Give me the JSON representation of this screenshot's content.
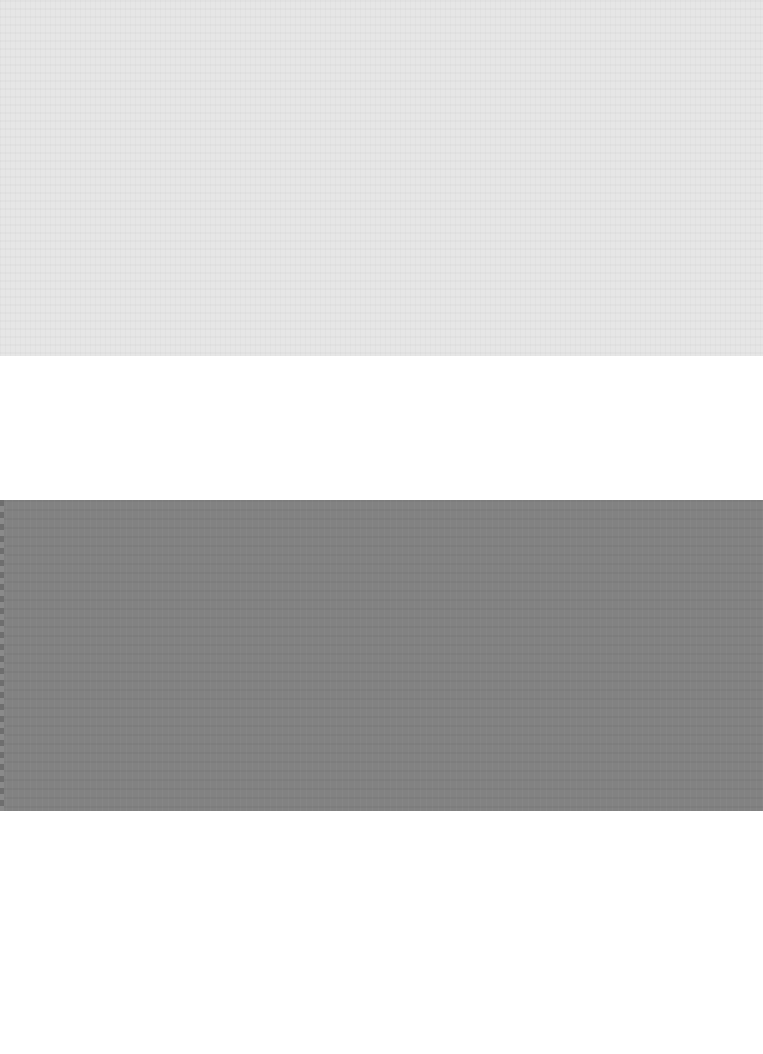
{
  "page": {
    "type": "scanned-blank-page",
    "bands": [
      {
        "name": "light-gray-band",
        "color": "#e6e6e6",
        "top": 0,
        "height": 356
      },
      {
        "name": "white-gap",
        "color": "#ffffff",
        "top": 356,
        "height": 144
      },
      {
        "name": "dark-gray-band",
        "color": "#828282",
        "top": 500,
        "height": 311
      },
      {
        "name": "white-bottom",
        "color": "#ffffff",
        "top": 811,
        "height": 243
      }
    ],
    "text": []
  }
}
